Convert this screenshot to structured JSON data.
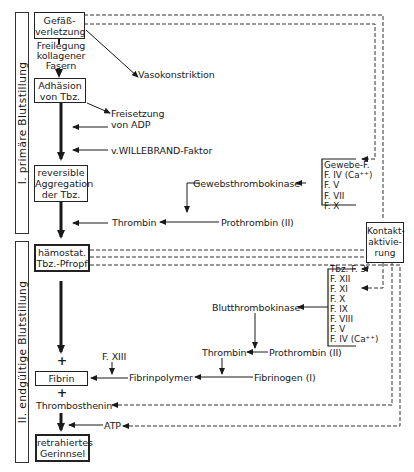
{
  "side_labels": {
    "primary": "I.  primäre  Blutstillung",
    "final": "II.  endgültige  Blutstillung"
  },
  "main_chain": {
    "gefaess": [
      "Gefäß-",
      "verletzung"
    ],
    "freilegung": [
      "Freilegung",
      "kollagener",
      "Fasern"
    ],
    "adhaesion": [
      "Adhäsion",
      "von Tbz."
    ],
    "aggregation": [
      "reversible",
      "Aggregation",
      "der Tbz."
    ],
    "pfropf": [
      "hämostat.",
      "Tbz.-Pfropf"
    ],
    "plus1": "+",
    "fibrin": "Fibrin",
    "plus2": "+",
    "thrombosthenin": "Thrombosthenin",
    "retrahiert": [
      "retrahiertes",
      "Gerinnsel"
    ]
  },
  "labels": {
    "vasokonstriktion": "Vasokonstriktion",
    "freisetzung": [
      "Freisetzung",
      "von ADP"
    ],
    "willebrand": "v.WILLEBRAND-Faktor",
    "gewebsthrombokinase": "Gewebsthrombokinase",
    "thrombin1": "Thrombin",
    "prothrombin1": "Prothrombin (II)",
    "blutthrombokinase": "Blutthrombokinase",
    "thrombin2": "Thrombin",
    "prothrombin2": "Prothrombin (II)",
    "fxiii": "F. XIII",
    "fibrinpolymer": "Fibrinpolymer",
    "fibrinogen": "Fibrinogen (I)",
    "atp": "ATP",
    "kontakt": [
      "Kontakt-",
      "aktivie-",
      "rung"
    ]
  },
  "extrinsic_factors": [
    "Gewebe-F.",
    "F. IV (Ca⁺⁺)",
    "F. V",
    "F. VII",
    "F. X"
  ],
  "intrinsic_factors": [
    "Tbz. F. 3",
    "F. XII",
    "F. XI",
    "F. X",
    "F. IX",
    "F. VIII",
    "F. V",
    "F. IV (Ca⁺⁺)"
  ]
}
